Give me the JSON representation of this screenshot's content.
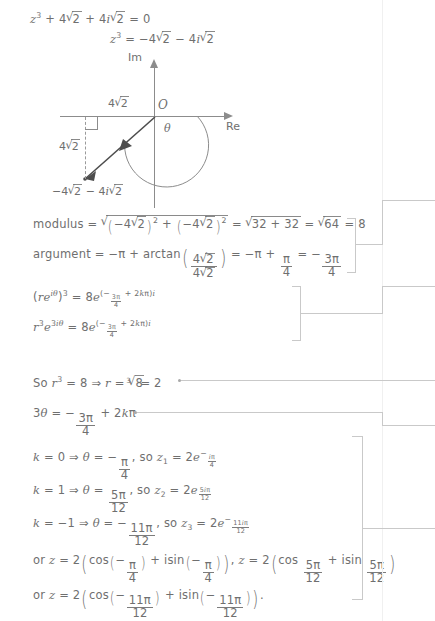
{
  "document": {
    "title": "Complex number cube roots working",
    "ink_color": "#6f6f6f",
    "annotation_color": "#c9c9c9"
  },
  "lines": {
    "eq1_lhs": "z",
    "eq1": "+ 4",
    "eq1_text": "z³ + 4√2 + 4i√2 = 0",
    "eq2_text": "z³ = −4√2 − 4i√2",
    "modulus_label": "modulus",
    "argument_label": "arctan",
    "modulus_text": "modulus = √((−4√2)² + (−4√2)²) = √(32 + 32) = √64 = 8",
    "argument_text": "argument = −π + arctan(4√2 / 4√2) = −π + π/4 = −3π/4",
    "line_re3": "(re^{iθ})³ = 8e^{(−3π/4 + 2kπ)i}",
    "line_r3e": "r³e^{3iθ} = 8e^{(−3π/4 + 2kπ)i}",
    "line_r": "So r³ = 8 ⇒ r = ∛8 = 2",
    "line_theta": "3θ = −3π/4 + 2kπ",
    "k0": "k = 0 ⇒ θ = −π/4, so z₁ = 2e^{−iπ/4}",
    "k1": "k = 1 ⇒ θ = 5π/12, so z₂ = 2e^{5iπ/12}",
    "km1": "k = −1 ⇒ θ = −11π/12, so z₃ = 2e^{−11iπ/12}",
    "trig1": "or z = 2(cos(−π/4) + isin(−π/4)), z = 2(cos 5π/12 + isin 5π/12)",
    "trig2": "or z = 2(cos(−11π/12) + isin(−11π/12))."
  },
  "tokens": {
    "z": "z",
    "cube": "3",
    "plus": "+",
    "minus": "−",
    "equals": "=",
    "zero": "0",
    "four": "4",
    "two": "2",
    "eight": "8",
    "i": "i",
    "pi": "π",
    "theta": "θ",
    "k": "k",
    "r": "r",
    "e": "e",
    "implies": "⇒",
    "twelve": "12",
    "eleven": "11",
    "five": "5",
    "three": "3",
    "thirtytwo": "32",
    "sixtyfour": "64",
    "so": "So",
    "so_lower": "so",
    "or": "or",
    "cos": "cos",
    "isin": "isin",
    "arctan": "arctan",
    "modulus_word": "modulus",
    "argument_word": "argument",
    "comma": ",",
    "period": ".",
    "twokpi": "2kπ"
  },
  "diagram": {
    "name": "argand-diagram",
    "axis_im_label": "Im",
    "axis_re_label": "Re",
    "origin_label": "O",
    "angle_label": "θ",
    "horizontal_leg_label": "4√2",
    "vertical_leg_label": "4√2",
    "point_label": "−4√2 − 4i√2",
    "leg_value": "4",
    "leg_radicand": "2",
    "point_real": "−4",
    "point_imag": "−4i"
  }
}
